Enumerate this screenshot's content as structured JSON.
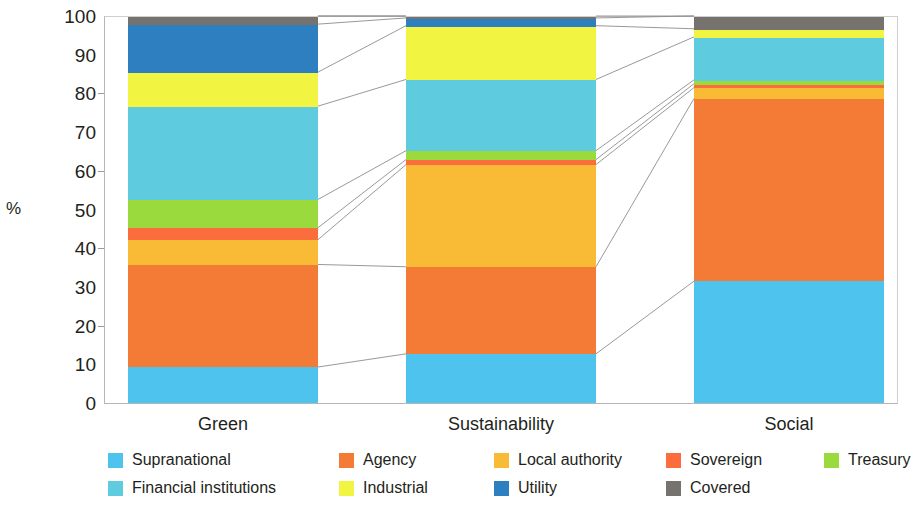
{
  "chart_data": {
    "type": "bar",
    "stacked": true,
    "stack_mode": "percent",
    "title": "",
    "xlabel": "",
    "ylabel": "%",
    "ylim": [
      0,
      100
    ],
    "yticks": [
      0,
      10,
      20,
      30,
      40,
      50,
      60,
      70,
      80,
      90,
      100
    ],
    "ytick_labels": [
      "0",
      "10",
      "20",
      "30",
      "40",
      "50",
      "60",
      "70",
      "80",
      "90",
      "100"
    ],
    "grid": false,
    "legend_position": "bottom",
    "categories": [
      "Green",
      "Sustainability",
      "Social"
    ],
    "series": [
      {
        "name": "Supranational",
        "color": "#4ec3ee",
        "values": [
          9.3,
          12.7,
          31.5
        ]
      },
      {
        "name": "Agency",
        "color": "#f47b35",
        "values": [
          26.5,
          22.5,
          47.2
        ]
      },
      {
        "name": "Local authority",
        "color": "#f9bb35",
        "values": [
          6.4,
          26.4,
          2.8
        ]
      },
      {
        "name": "Sovereign",
        "color": "#fb6d3c",
        "values": [
          3.1,
          1.3,
          1.0
        ]
      },
      {
        "name": "Treasury",
        "color": "#9ada3c",
        "values": [
          7.3,
          2.3,
          1.0
        ]
      },
      {
        "name": "Financial institutions",
        "color": "#5fcbdf",
        "values": [
          24.1,
          18.4,
          11.1
        ]
      },
      {
        "name": "Industrial",
        "color": "#f2f442",
        "values": [
          8.8,
          13.9,
          2.1
        ]
      },
      {
        "name": "Utility",
        "color": "#2e7fc0",
        "values": [
          12.4,
          2.0,
          0.0
        ]
      },
      {
        "name": "Covered",
        "color": "#76736e",
        "values": [
          2.1,
          0.5,
          3.3
        ]
      }
    ]
  },
  "axis": {
    "y_title": "%",
    "y_ticks": [
      "100",
      "90",
      "80",
      "70",
      "60",
      "50",
      "40",
      "30",
      "20",
      "10",
      "0"
    ],
    "x_labels": [
      "Green",
      "Sustainability",
      "Social"
    ]
  },
  "legend": {
    "row1": [
      {
        "label": "Supranational",
        "color": "#4ec3ee"
      },
      {
        "label": "Agency",
        "color": "#f47b35"
      },
      {
        "label": "Local authority",
        "color": "#f9bb35"
      },
      {
        "label": "Sovereign",
        "color": "#fb6d3c"
      },
      {
        "label": "Treasury",
        "color": "#9ada3c"
      }
    ],
    "row2": [
      {
        "label": "Financial institutions",
        "color": "#5fcbdf"
      },
      {
        "label": "Industrial",
        "color": "#f2f442"
      },
      {
        "label": "Utility",
        "color": "#2e7fc0"
      },
      {
        "label": "Covered",
        "color": "#76736e"
      }
    ]
  }
}
